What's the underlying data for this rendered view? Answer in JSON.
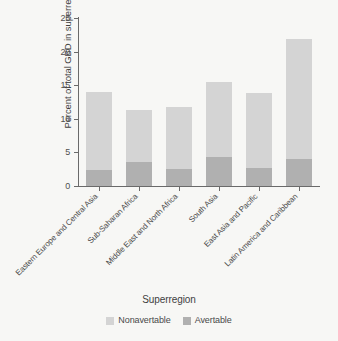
{
  "chart_data": {
    "type": "bar",
    "subtype": "stacked",
    "title": "",
    "xlabel": "Superregion",
    "ylabel": "Percent of total GBD in superregions",
    "ylim": [
      0,
      25
    ],
    "yticks": [
      0,
      5,
      10,
      15,
      20,
      25
    ],
    "grid": false,
    "legend_position": "bottom",
    "categories": [
      "Eastern Europe and Central Asia",
      "Sub-Saharan Africa",
      "Middle East and North Africa",
      "South Asia",
      "East Asia  and Pacific",
      "Latin America and Caribbean"
    ],
    "series": [
      {
        "name": "Avertable",
        "color": "#b0b0b0",
        "values": [
          2.4,
          3.6,
          2.6,
          4.3,
          2.7,
          4.0
        ]
      },
      {
        "name": "Nonavertable",
        "color": "#d4d4d4",
        "values": [
          11.6,
          7.7,
          9.2,
          11.2,
          11.2,
          17.9
        ]
      }
    ],
    "totals": [
      14.0,
      11.3,
      11.8,
      15.5,
      13.9,
      21.9
    ]
  },
  "legend": {
    "entries": [
      {
        "label": "Nonavertable",
        "color": "#d4d4d4"
      },
      {
        "label": "Avertable",
        "color": "#b0b0b0"
      }
    ]
  },
  "colors": {
    "background": "#f7f7f5",
    "axis": "#6a6a6a",
    "text": "#4a4a4a",
    "nonavertable": "#d4d4d4",
    "avertable": "#b0b0b0"
  }
}
